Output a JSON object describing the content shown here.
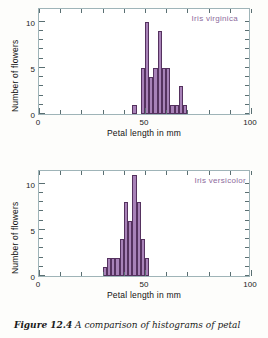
{
  "figure": {
    "caption_label": "Figure 12.4",
    "caption_text": "A comparison of histograms of petal",
    "bar_color": "#a882b8",
    "bar_edge_color": "#55325f",
    "axis_color": "#9fb4b8",
    "label_color": "#8d6b9c"
  },
  "chart_data": [
    {
      "type": "bar",
      "title": "",
      "series_label": "Iris virginica",
      "xlabel": "Petal length in mm",
      "ylabel": "Number of flowers",
      "xlim": [
        0,
        100
      ],
      "ylim": [
        0,
        11.6
      ],
      "xticks": [
        0,
        10,
        20,
        30,
        40,
        50,
        60,
        70,
        80,
        90,
        100
      ],
      "xticklabels": [
        "0",
        "",
        "",
        "",
        "",
        "50",
        "",
        "",
        "",
        "",
        "100"
      ],
      "yticks": [
        0,
        1,
        2,
        3,
        4,
        5,
        6,
        7,
        8,
        9,
        10
      ],
      "yticklabels": [
        "0",
        "",
        "",
        "",
        "",
        "5",
        "",
        "",
        "",
        "",
        "10"
      ],
      "grid": false,
      "legend_position": "top-right",
      "bin_width": 2,
      "bins": [
        45,
        47,
        49,
        51,
        53,
        55,
        57,
        59,
        61,
        63,
        65,
        67,
        69
      ],
      "categories": [
        "45",
        "47",
        "49",
        "51",
        "53",
        "55",
        "57",
        "59",
        "61",
        "63",
        "65",
        "67",
        "69"
      ],
      "values": [
        1,
        0,
        5,
        10,
        4,
        5,
        9,
        5,
        5,
        1,
        1,
        3,
        1
      ]
    },
    {
      "type": "bar",
      "title": "",
      "series_label": "Iris versicolor",
      "xlabel": "Petal length in mm",
      "ylabel": "Number of flowers",
      "xlim": [
        0,
        100
      ],
      "ylim": [
        0,
        11.6
      ],
      "xticks": [
        0,
        10,
        20,
        30,
        40,
        50,
        60,
        70,
        80,
        90,
        100
      ],
      "xticklabels": [
        "0",
        "",
        "",
        "",
        "",
        "50",
        "",
        "",
        "",
        "",
        "100"
      ],
      "yticks": [
        0,
        1,
        2,
        3,
        4,
        5,
        6,
        7,
        8,
        9,
        10
      ],
      "yticklabels": [
        "0",
        "",
        "",
        "",
        "",
        "5",
        "",
        "",
        "",
        "",
        "10"
      ],
      "grid": false,
      "legend_position": "top-right",
      "bin_width": 2,
      "bins": [
        31,
        33,
        35,
        37,
        39,
        41,
        43,
        45,
        47,
        49,
        51
      ],
      "categories": [
        "31",
        "33",
        "35",
        "37",
        "39",
        "41",
        "43",
        "45",
        "47",
        "49",
        "51"
      ],
      "values": [
        1,
        2,
        2,
        2,
        4,
        8,
        6,
        11,
        8,
        4,
        2
      ]
    }
  ]
}
